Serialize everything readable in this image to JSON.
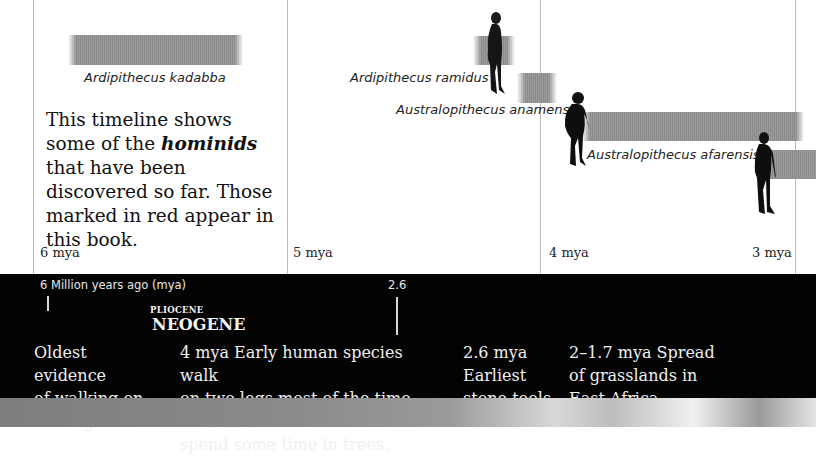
{
  "timeline": {
    "ticks": [
      {
        "label": "6 mya"
      },
      {
        "label": "5 mya"
      },
      {
        "label": "4 mya"
      },
      {
        "label": "3 mya"
      }
    ],
    "intro": {
      "before": "This timeline shows some of the ",
      "emphasis": "hominids",
      "after": " that have been discovered so far. Those marked in red appear in this book."
    },
    "species": [
      {
        "name": "Ardipithecus kadabba"
      },
      {
        "name": "Ardipithecus ramidus"
      },
      {
        "name": "Australopithecus anamensis"
      },
      {
        "name": "Australopithecus afarensis"
      }
    ],
    "colors": {
      "bar": "#8f8f8f",
      "gridline": "#b9b9b9",
      "band": "#030303"
    }
  },
  "band": {
    "scale_start": "6 Million years ago (mya)",
    "scale_marker": "2.6",
    "epoch": "PLIOCENE",
    "period": "NEOGENE",
    "events": [
      {
        "lines": [
          "Oldest evidence",
          "of walking on",
          "two legs."
        ]
      },
      {
        "lines": [
          "4 mya Early human species walk",
          "on two legs most of the time but",
          "spend some time in trees."
        ]
      },
      {
        "lines": [
          "2.6 mya",
          "Earliest",
          "stone tools."
        ]
      },
      {
        "lines": [
          "2–1.7 mya Spread",
          "of grasslands in",
          "East Africa."
        ]
      }
    ]
  }
}
